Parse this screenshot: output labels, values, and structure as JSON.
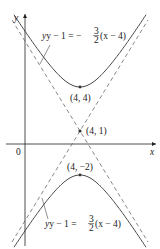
{
  "figure": {
    "axes": {
      "x_label": "x",
      "y_label": "y",
      "origin_label": "0"
    },
    "points": [
      {
        "label": "(4, 4)",
        "role": "vertex-upper"
      },
      {
        "label": "(4, 1)",
        "role": "center"
      },
      {
        "label": "(4, −2)",
        "role": "vertex-lower"
      }
    ],
    "asymptotes": {
      "upper_label_lhs": "y − 1 = −",
      "upper_label_frac_num": "3",
      "upper_label_frac_den": "2",
      "upper_label_rhs": "(x − 4)",
      "lower_label_lhs": "y − 1 = ",
      "lower_label_frac_num": "3",
      "lower_label_frac_den": "2",
      "lower_label_rhs": "(x − 4)"
    },
    "colors": {
      "curve": "#333333",
      "axis": "#222222",
      "dash": "#555555"
    }
  }
}
